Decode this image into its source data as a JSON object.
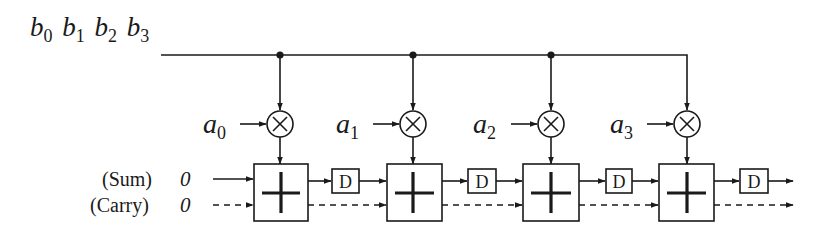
{
  "diagram": {
    "type": "systolic-multiply-accumulate-array",
    "input_bus": {
      "label_terms": [
        {
          "base": "b",
          "sub": "0"
        },
        {
          "base": "b",
          "sub": "1"
        },
        {
          "base": "b",
          "sub": "2"
        },
        {
          "base": "b",
          "sub": "3"
        }
      ]
    },
    "coefficients": [
      {
        "base": "a",
        "sub": "0"
      },
      {
        "base": "a",
        "sub": "1"
      },
      {
        "base": "a",
        "sub": "2"
      },
      {
        "base": "a",
        "sub": "3"
      }
    ],
    "inputs": {
      "sum": {
        "label": "(Sum)",
        "value": "0"
      },
      "carry": {
        "label": "(Carry)",
        "value": "0"
      }
    },
    "multiplier_symbol": "⊗",
    "adder_symbol": "+",
    "delay_label": "D",
    "stage_count": 4,
    "colors": {
      "ink": "#1a1a1a",
      "background": "#ffffff"
    }
  }
}
